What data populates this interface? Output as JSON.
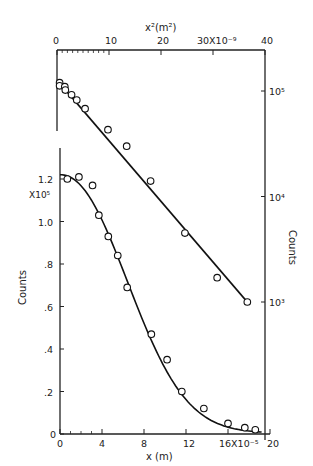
{
  "chart_data": [
    {
      "type": "scatter",
      "title": "",
      "xlabel": "x² (m²)",
      "ylabel": "Counts",
      "x_scale_label": "×10⁻⁹",
      "y_scale": "log",
      "xlim": [
        0,
        40
      ],
      "ylim": [
        1000,
        100000
      ],
      "x_ticks": [
        "0",
        "10",
        "20",
        "30X10⁻⁹",
        "40"
      ],
      "y_ticks": [
        "10⁵",
        "10⁴",
        "10³"
      ],
      "fit_line": "straight line (Gaussian profile)",
      "series": [
        {
          "name": "Counts vs x²",
          "x": [
            0.5,
            0.5,
            1.5,
            1.6,
            2.8,
            3.8,
            5.4,
            9.8,
            13.4,
            18.0,
            24.6,
            30.8,
            36.6
          ],
          "y": [
            120000,
            112000,
            110000,
            102000,
            92000,
            82000,
            68000,
            43000,
            30000,
            14000,
            4500,
            1700,
            1000
          ]
        }
      ]
    },
    {
      "type": "scatter",
      "title": "",
      "xlabel": "x (m)",
      "ylabel": "Counts",
      "x_scale_label": "×10⁻⁵",
      "y_scale_label": "X10⁵",
      "xlim": [
        0,
        20
      ],
      "ylim": [
        0,
        1.3
      ],
      "x_ticks": [
        "0",
        "4",
        "8",
        "12",
        "16X10⁻⁵",
        "20"
      ],
      "y_ticks": [
        "0",
        ".2",
        ".4",
        ".6",
        ".8",
        "1.0",
        "1.2"
      ],
      "fit_line": "smooth Gaussian curve",
      "series": [
        {
          "name": "Counts vs x",
          "x": [
            0.7,
            1.8,
            3.1,
            3.7,
            4.6,
            5.5,
            6.4,
            8.7,
            10.2,
            11.6,
            13.7,
            16.0,
            17.6,
            18.6
          ],
          "y": [
            1.2,
            1.21,
            1.17,
            1.03,
            0.93,
            0.84,
            0.69,
            0.47,
            0.35,
            0.2,
            0.12,
            0.05,
            0.03,
            0.02
          ]
        }
      ]
    }
  ],
  "labels": {
    "top_xlabel": "x²(m²)",
    "right_ylabel": "Counts",
    "left_ylabel": "Counts",
    "bottom_xlabel": "x (m)",
    "y_multiplier": "X10⁵"
  }
}
